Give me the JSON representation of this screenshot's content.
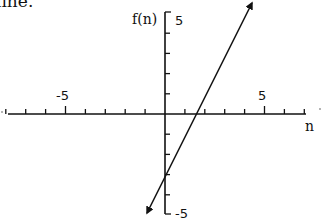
{
  "caption": "line.",
  "chart_data": {
    "type": "line",
    "title": "",
    "xlabel": "n",
    "ylabel": "f(n)",
    "xlim": [
      -8,
      7
    ],
    "ylim": [
      -5,
      5
    ],
    "x_tick_labels": [
      "-5",
      "5"
    ],
    "y_tick_labels": [
      "5",
      "-5"
    ],
    "x_tick_step": 1,
    "y_tick_step": 1,
    "grid": false,
    "legend": null,
    "series": [
      {
        "name": "f(n) = 2n - 3",
        "x": [
          -1,
          0,
          1.5,
          4.3
        ],
        "values": [
          -5,
          -3,
          0,
          5.6
        ],
        "arrows": "both"
      }
    ]
  },
  "axes": {
    "x_label": "n",
    "y_label": "f(n)",
    "x_neg_label": "-5",
    "x_pos_label": "5",
    "y_pos_label": "5",
    "y_neg_label": "-5"
  },
  "colors": {
    "ink": "#111111",
    "background": "#ffffff"
  }
}
